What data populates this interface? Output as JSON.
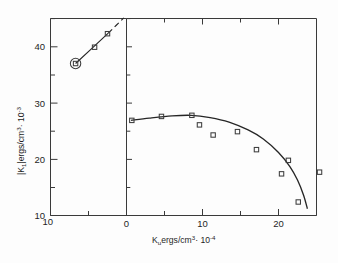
{
  "chart_data": {
    "type": "scatter",
    "title": "",
    "xlabel": "K_u  ergs/cm^3 · 10^-4",
    "ylabel": "|K_1|  ergs/cm^3 · 10^-3",
    "xlabel_parts": {
      "symbol": "K",
      "symbol_sub": "u",
      "units": "ergs/cm",
      "units_exp": "3",
      "mult": "· 10",
      "mult_exp": "-4"
    },
    "ylabel_parts": {
      "symbol": "|K",
      "symbol_sub": "1",
      "symbol_close": "|",
      "units": "ergs/cm",
      "units_exp": "3",
      "mult": "· 10",
      "mult_exp": "-3"
    },
    "xlim": [
      -10,
      25
    ],
    "ylim": [
      10,
      45
    ],
    "x_break_at": 0,
    "grid": false,
    "legend": null,
    "xticks_major": [
      -10,
      0,
      10,
      20
    ],
    "xticks_major_labels": [
      "10",
      "0",
      "10",
      "20"
    ],
    "xticks_minor": [
      -5,
      5,
      15,
      25
    ],
    "yticks_major": [
      10,
      20,
      30,
      40
    ],
    "yticks_major_labels": [
      "10",
      "20",
      "30",
      "40"
    ],
    "yticks_minor": [
      15,
      25,
      35,
      45
    ],
    "series": [
      {
        "name": "negative-Ku-branch",
        "marker": "open-square",
        "panel": "left",
        "points": [
          {
            "x": -6.7,
            "y": 37.0,
            "circled": true
          },
          {
            "x": -4.2,
            "y": 39.9,
            "circled": false
          },
          {
            "x": -2.5,
            "y": 42.3,
            "circled": false
          }
        ],
        "fit_solid": [
          {
            "x": -6.7,
            "y": 37.0
          },
          {
            "x": -2.4,
            "y": 42.4
          }
        ],
        "fit_dashed": [
          {
            "x": -2.4,
            "y": 42.4
          },
          {
            "x": -0.35,
            "y": 45.1
          }
        ]
      },
      {
        "name": "positive-Ku-branch",
        "marker": "open-square",
        "panel": "right",
        "points": [
          {
            "x": 0.7,
            "y": 26.9,
            "circled": false
          },
          {
            "x": 4.6,
            "y": 27.6,
            "circled": false
          },
          {
            "x": 8.6,
            "y": 27.8,
            "circled": false
          },
          {
            "x": 9.6,
            "y": 26.1,
            "circled": false
          },
          {
            "x": 11.4,
            "y": 24.3,
            "circled": false
          },
          {
            "x": 14.6,
            "y": 24.9,
            "circled": false
          },
          {
            "x": 17.1,
            "y": 21.7,
            "circled": false
          },
          {
            "x": 20.4,
            "y": 17.4,
            "circled": false
          },
          {
            "x": 21.3,
            "y": 19.8,
            "circled": false
          },
          {
            "x": 22.6,
            "y": 12.4,
            "circled": false
          },
          {
            "x": 25.4,
            "y": 17.7,
            "circled": false,
            "outside_frame": true
          }
        ],
        "fit_solid": [
          {
            "x": 0.6,
            "y": 26.9
          },
          {
            "x": 3.0,
            "y": 27.3
          },
          {
            "x": 6.0,
            "y": 27.7
          },
          {
            "x": 8.5,
            "y": 27.8
          },
          {
            "x": 11.0,
            "y": 27.4
          },
          {
            "x": 13.5,
            "y": 26.6
          },
          {
            "x": 16.0,
            "y": 25.2
          },
          {
            "x": 18.0,
            "y": 23.6
          },
          {
            "x": 20.0,
            "y": 21.2
          },
          {
            "x": 21.5,
            "y": 18.7
          },
          {
            "x": 22.5,
            "y": 16.3
          },
          {
            "x": 23.3,
            "y": 13.6
          },
          {
            "x": 23.8,
            "y": 11.2
          }
        ]
      }
    ]
  },
  "figure": {
    "marker_size": 4.4,
    "circle_radius": 5.2,
    "line_color": "#262626",
    "axis_color": "#3a3a3a",
    "marker_color": "#3d3d3d"
  }
}
